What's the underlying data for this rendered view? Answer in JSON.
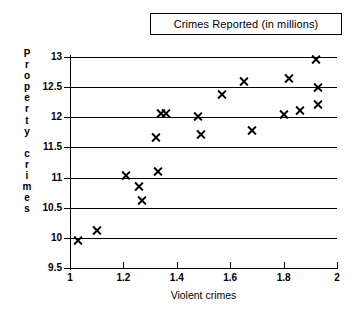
{
  "chart_data": {
    "type": "scatter",
    "title": "Crimes Reported (in millions)",
    "xlabel": "Violent crimes",
    "ylabel": "Property crimes",
    "xlim": [
      1,
      2
    ],
    "ylim": [
      9.5,
      13
    ],
    "grid": true,
    "legend": null,
    "x_ticks": [
      "1",
      "1.2",
      "1.4",
      "1.6",
      "1.8",
      "2"
    ],
    "x_tick_values": [
      1,
      1.2,
      1.4,
      1.6,
      1.8,
      2
    ],
    "y_ticks": [
      "9.5",
      "10",
      "10.5",
      "11",
      "11.5",
      "12",
      "12.5",
      "13"
    ],
    "y_tick_values": [
      9.5,
      10,
      10.5,
      11,
      11.5,
      12,
      12.5,
      13
    ],
    "marker": "x",
    "marker_color": "#000000",
    "points": [
      {
        "x": 1.03,
        "y": 9.96
      },
      {
        "x": 1.1,
        "y": 10.13
      },
      {
        "x": 1.21,
        "y": 11.03
      },
      {
        "x": 1.26,
        "y": 10.85
      },
      {
        "x": 1.27,
        "y": 10.62
      },
      {
        "x": 1.32,
        "y": 11.66
      },
      {
        "x": 1.33,
        "y": 11.1
      },
      {
        "x": 1.34,
        "y": 12.06
      },
      {
        "x": 1.36,
        "y": 12.06
      },
      {
        "x": 1.48,
        "y": 12.02
      },
      {
        "x": 1.49,
        "y": 11.71
      },
      {
        "x": 1.57,
        "y": 12.38
      },
      {
        "x": 1.65,
        "y": 12.6
      },
      {
        "x": 1.68,
        "y": 11.78
      },
      {
        "x": 1.8,
        "y": 12.05
      },
      {
        "x": 1.82,
        "y": 12.64
      },
      {
        "x": 1.86,
        "y": 12.12
      },
      {
        "x": 1.92,
        "y": 12.96
      },
      {
        "x": 1.93,
        "y": 12.5
      },
      {
        "x": 1.93,
        "y": 12.21
      }
    ]
  },
  "y_axis_title_letters": [
    "P",
    "r",
    "o",
    "p",
    "e",
    "r",
    "t",
    "y",
    "",
    "c",
    "r",
    "i",
    "m",
    "e",
    "s"
  ]
}
